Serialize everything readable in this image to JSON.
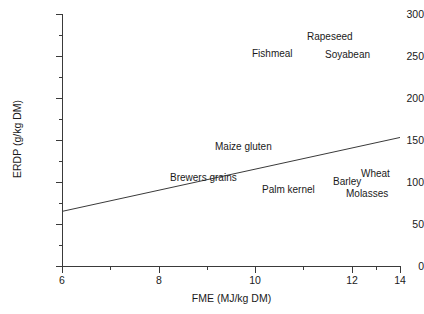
{
  "chart_data": {
    "type": "scatter",
    "title": "",
    "xlabel": "FME (MJ/kg DM)",
    "ylabel": "ERDP (g/kg DM)",
    "xlim": [
      6,
      14
    ],
    "ylim": [
      0,
      300
    ],
    "grid": false,
    "legend": "none",
    "xticks": [
      6,
      8,
      10,
      12,
      14
    ],
    "xtick_labels": [
      "6",
      "8",
      "10",
      "12",
      "14"
    ],
    "xminorticks": [
      7,
      9,
      11,
      13
    ],
    "yticks": [
      0,
      50,
      100,
      150,
      200,
      250,
      300
    ],
    "ytick_labels": [
      "0",
      "50",
      "100",
      "150",
      "200",
      "250",
      "300"
    ],
    "yminorticks": [
      25,
      75,
      125,
      175,
      225,
      275
    ],
    "points": [
      {
        "label": "Rapeseed",
        "x": 11.7,
        "y": 272
      },
      {
        "label": "Fishmeal",
        "x": 10.9,
        "y": 257
      },
      {
        "label": "Soyabean",
        "x": 12.3,
        "y": 256
      },
      {
        "label": "Maize gluten",
        "x": 10.1,
        "y": 150
      },
      {
        "label": "Brewers grains",
        "x": 9.1,
        "y": 113
      },
      {
        "label": "Wheat",
        "x": 13.0,
        "y": 116
      },
      {
        "label": "Barley",
        "x": 12.3,
        "y": 108
      },
      {
        "label": "Palm kernel",
        "x": 12.0,
        "y": 98
      },
      {
        "label": "Molasses",
        "x": 12.7,
        "y": 94
      }
    ],
    "trendline": {
      "label": "regression-line",
      "x_start": 6,
      "y_start": 65,
      "x_end": 14,
      "y_end": 153
    }
  }
}
